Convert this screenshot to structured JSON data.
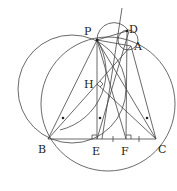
{
  "diagram": {
    "type": "geometry",
    "points": [
      {
        "id": "P",
        "label": "P",
        "x": 97,
        "y": 40,
        "lx": 84,
        "ly": 35
      },
      {
        "id": "D",
        "label": "D",
        "x": 127,
        "y": 31,
        "lx": 129,
        "ly": 33
      },
      {
        "id": "A",
        "label": "A",
        "x": 131,
        "y": 46,
        "lx": 134,
        "ly": 50
      },
      {
        "id": "H",
        "label": "H",
        "x": 97,
        "y": 84,
        "lx": 84,
        "ly": 88
      },
      {
        "id": "B",
        "label": "B",
        "x": 48,
        "y": 139,
        "lx": 38,
        "ly": 153
      },
      {
        "id": "E",
        "label": "E",
        "x": 97,
        "y": 139,
        "lx": 92,
        "ly": 155
      },
      {
        "id": "F",
        "label": "F",
        "x": 126,
        "y": 139,
        "lx": 121,
        "ly": 155
      },
      {
        "id": "C",
        "label": "C",
        "x": 156,
        "y": 139,
        "lx": 158,
        "ly": 153
      }
    ],
    "labels": {
      "P": "P",
      "D": "D",
      "A": "A",
      "H": "H",
      "B": "B",
      "E": "E",
      "F": "F",
      "C": "C"
    }
  }
}
